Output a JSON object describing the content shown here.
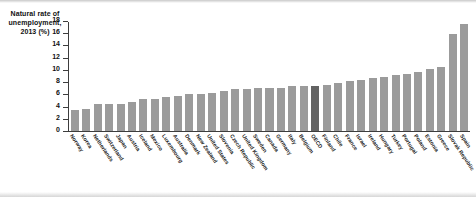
{
  "chart_data": {
    "type": "bar",
    "title": "",
    "ylabel": "Natural rate of unemployment, 2013 (%)",
    "xlabel": "",
    "ylim": [
      0,
      18
    ],
    "yticks": [
      0,
      2,
      4,
      6,
      8,
      10,
      12,
      14,
      16,
      18
    ],
    "grid": false,
    "legend": "none",
    "highlight_category": "OECD",
    "highlight_color": "#636363",
    "bar_color": "#9b9b9b",
    "categories": [
      "Norway",
      "Korea",
      "Netherlands",
      "Switzerland",
      "Japan",
      "Austria",
      "Iceland",
      "Mexico",
      "Luxembourg",
      "Australia",
      "Denmark",
      "New Zealand",
      "United States",
      "Slovenia",
      "Czech Republic",
      "United Kingdom",
      "Sweden",
      "Canada",
      "Germany",
      "Italy",
      "Belgium",
      "OECD",
      "Finland",
      "Chile",
      "France",
      "Israel",
      "Ireland",
      "Hungary",
      "Turkey",
      "Portugal",
      "Poland",
      "Estonia",
      "Greece",
      "Slovak Republic",
      "Spain"
    ],
    "values": [
      3.4,
      3.6,
      4.4,
      4.4,
      4.5,
      4.7,
      5.2,
      5.2,
      5.5,
      5.7,
      6.1,
      6.1,
      6.3,
      6.6,
      6.8,
      6.9,
      7.0,
      7.0,
      7.1,
      7.3,
      7.4,
      7.4,
      7.6,
      7.9,
      8.2,
      8.4,
      8.7,
      8.9,
      9.2,
      9.4,
      9.7,
      10.1,
      10.4,
      15.9,
      17.5
    ]
  },
  "yaxis": {
    "labels": [
      "18",
      "16",
      "14",
      "12",
      "10",
      "8",
      "6",
      "4",
      "2",
      "0"
    ]
  },
  "axis_title": {
    "line1": "Natural rate of",
    "line2": "unemployment,",
    "line3": "2013 (%)"
  }
}
